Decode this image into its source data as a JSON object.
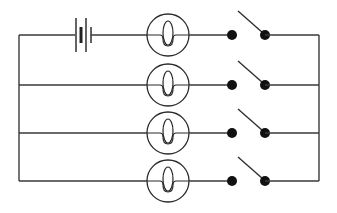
{
  "diagram": {
    "type": "electrical-circuit",
    "colors": {
      "line": "#3a3a3a",
      "terminal": "#111111",
      "background": "#ffffff"
    },
    "rails": {
      "left_x": 19,
      "right_x": 319
    },
    "battery": {
      "branch": 0,
      "cells": 2,
      "icon": "battery-icon"
    },
    "branches": [
      {
        "id": 1,
        "y": 35,
        "components": [
          "battery",
          "lamp",
          "open-switch"
        ]
      },
      {
        "id": 2,
        "y": 85,
        "components": [
          "lamp",
          "open-switch"
        ]
      },
      {
        "id": 3,
        "y": 133,
        "components": [
          "lamp",
          "open-switch"
        ]
      },
      {
        "id": 4,
        "y": 181,
        "components": [
          "lamp",
          "open-switch"
        ]
      }
    ],
    "lamp": {
      "icon": "lamp-icon",
      "cx": 168,
      "r": 21
    },
    "switch": {
      "icon": "switch-icon",
      "state": "open",
      "left_terminal_x": 232,
      "right_terminal_x": 265
    }
  }
}
